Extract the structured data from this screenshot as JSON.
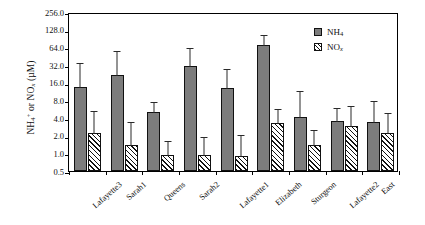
{
  "chart_data": {
    "type": "bar",
    "title": "",
    "xlabel": "",
    "ylabel": "NH4+ or NOx (uM)",
    "yscale": "log2",
    "ylim": [
      0.5,
      256.0
    ],
    "ytick_labels": [
      "256.0",
      "128.0",
      "64.0",
      "32.0",
      "16.0",
      "8.0",
      "4.0",
      "2.0",
      "1.0",
      "0.5"
    ],
    "ytick_values": [
      256.0,
      128.0,
      64.0,
      32.0,
      16.0,
      8.0,
      4.0,
      2.0,
      1.0,
      0.5
    ],
    "grid": false,
    "legend_position": "top-right",
    "categories": [
      "Lafayette3",
      "Sarah1",
      "Queens",
      "Sarah2",
      "Lafayette1",
      "Elizabeth",
      "Sturgeon",
      "Lafayette2",
      "East"
    ],
    "series": [
      {
        "name": "NH4",
        "values": [
          13.5,
          22.0,
          5.0,
          31.0,
          13.0,
          70.0,
          4.1,
          3.6,
          3.4
        ],
        "err_upper": [
          36.0,
          57.0,
          7.8,
          65.0,
          28.0,
          110.0,
          12.0,
          6.2,
          8.2
        ],
        "err_lower": [
          13.5,
          22.0,
          5.0,
          31.0,
          13.0,
          70.0,
          4.1,
          3.6,
          3.4
        ]
      },
      {
        "name": "NOx",
        "values": [
          2.2,
          1.4,
          0.95,
          0.93,
          0.9,
          3.3,
          1.4,
          2.9,
          2.2
        ],
        "err_upper": [
          5.5,
          3.6,
          1.7,
          1.95,
          2.1,
          6.0,
          2.6,
          6.6,
          5.0
        ],
        "err_lower": [
          2.2,
          1.4,
          0.95,
          0.93,
          0.9,
          3.3,
          1.4,
          2.9,
          2.2
        ]
      }
    ]
  },
  "legend": {
    "entries": [
      {
        "label": "NH4",
        "base": "NH",
        "sub": "4",
        "style": "solid-gray"
      },
      {
        "label": "NOx",
        "base": "NO",
        "sub": "x",
        "style": "hatched"
      }
    ]
  },
  "axis": {
    "y_title_parts": {
      "nh": "NH",
      "nh_sub": "4",
      "nh_sup": "+",
      "or": " or ",
      "no": "NO",
      "no_sub": "x",
      "unit": " (µM)"
    }
  }
}
